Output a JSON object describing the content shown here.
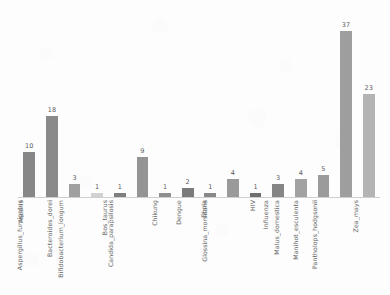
{
  "chart_data": {
    "type": "bar",
    "title": "",
    "subtitle": "",
    "xlabel": "",
    "ylabel": "",
    "grid": false,
    "legend": false,
    "ylim": [
      0,
      40
    ],
    "categories": [
      "Ascaris",
      "Aspergillus_fumigatus",
      "Bacteroides_dorei",
      "Bifidobacterium_longum",
      "Bos_taurus",
      "Candida_parapsilosis",
      "Chikung",
      "Dengue",
      "Ebola",
      "Glossina_morsitans",
      "HIV",
      "Influenza",
      "Malus_domestica",
      "Manihot_esculenta",
      "Pantholops_hodgsonii",
      "Zea_mays"
    ],
    "values": [
      10,
      18,
      3,
      1,
      1,
      9,
      1,
      2,
      1,
      4,
      1,
      3,
      4,
      5,
      37,
      23
    ],
    "bar_colors": [
      "#878787",
      "#8a8a8a",
      "#a0a0a0",
      "#d2d2d2",
      "#7e7e7e",
      "#949494",
      "#8f8f8f",
      "#7b7b7b",
      "#888888",
      "#9a9a9a",
      "#6f6f6f",
      "#858585",
      "#a2a2a2",
      "#9b9b9b",
      "#9e9e9e",
      "#b4b4b4"
    ],
    "axis_color": "#cfcfcf",
    "value_label_color": "#5a5a5a",
    "category_label_color": "#666666",
    "background_color": "#fdfdfd"
  }
}
